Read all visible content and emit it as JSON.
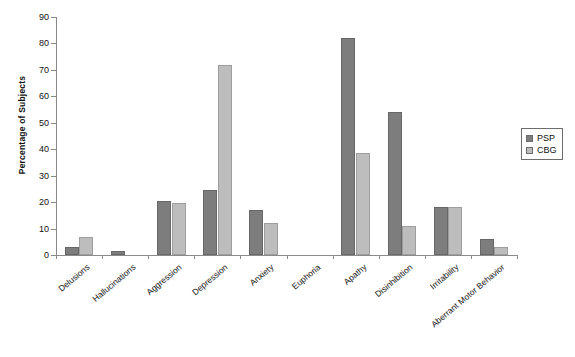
{
  "chart_data": {
    "type": "bar",
    "title": "",
    "subtitle": "",
    "xlabel": "",
    "ylabel": "Percentage of Subjects",
    "ylim": [
      0,
      90
    ],
    "ytick_step": 10,
    "yticks": [
      0,
      10,
      20,
      30,
      40,
      50,
      60,
      70,
      80,
      90
    ],
    "grid": false,
    "legend_position": "right",
    "categories": [
      "Delusions",
      "Hallucinations",
      "Aggression",
      "Depression",
      "Anxiety",
      "Euphoria",
      "Apathy",
      "Disinhibition",
      "Irritability",
      "Aberrant Motor Behavior"
    ],
    "series": [
      {
        "name": "PSP",
        "color": "#7d7d7d",
        "values": [
          3,
          1.5,
          20.5,
          24.5,
          17,
          0,
          82,
          54,
          18,
          6
        ]
      },
      {
        "name": "CBG",
        "color": "#bdbdbd",
        "values": [
          7,
          0,
          19.5,
          72,
          12,
          0,
          38.5,
          11,
          18,
          3
        ]
      }
    ]
  },
  "legend": {
    "items": [
      {
        "label": "PSP",
        "swatch": "psp"
      },
      {
        "label": "CBG",
        "swatch": "cbg"
      }
    ]
  },
  "caption": {
    "text": ""
  }
}
